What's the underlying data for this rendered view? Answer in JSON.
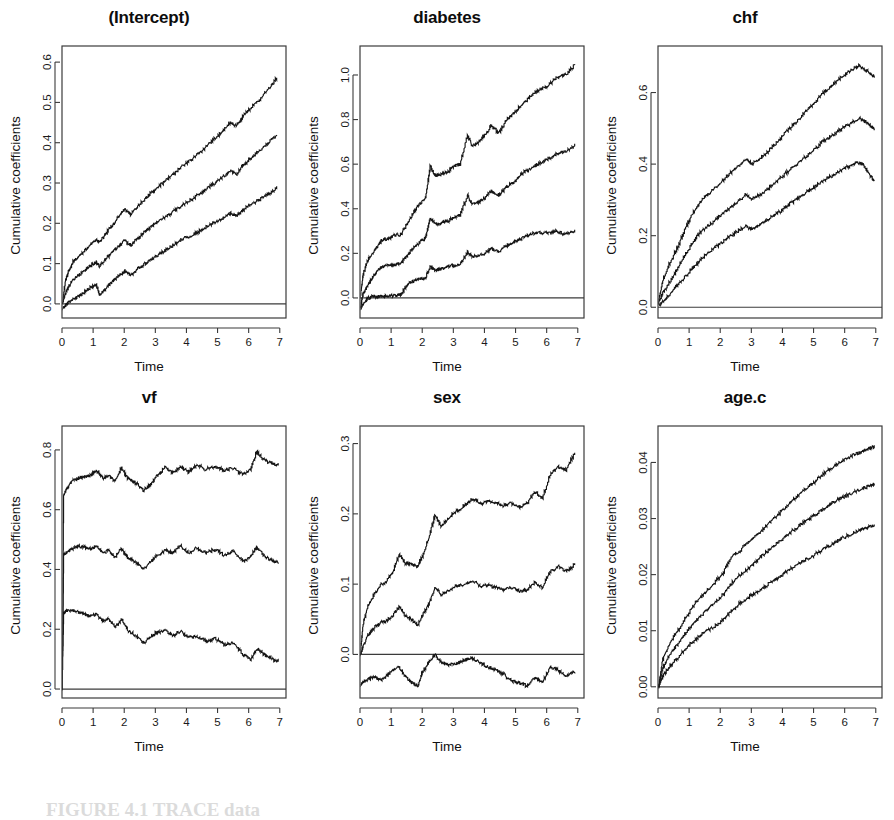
{
  "figure": {
    "caption": "FIGURE 4.1 TRACE data",
    "y_axis_label": "Cumulative coefficients",
    "x_axis_label": "Time"
  },
  "chart_data": [
    {
      "type": "line",
      "title": "(Intercept)",
      "xlabel": "Time",
      "ylabel": "Cumulative coefficients",
      "xlim": [
        0,
        7.2
      ],
      "ylim": [
        -0.035,
        0.64
      ],
      "xticks": [
        0,
        1,
        2,
        3,
        4,
        5,
        6,
        7
      ],
      "yticks": [
        0.0,
        0.1,
        0.2,
        0.3,
        0.4,
        0.5,
        0.6
      ],
      "ytick_labels": [
        "0.0",
        "0.1",
        "0.2",
        "0.3",
        "0.4",
        "0.5",
        "0.6"
      ],
      "grid": false,
      "legend": "none",
      "zero_line": 0.0,
      "x": [
        0,
        0.1,
        0.2,
        0.35,
        0.5,
        0.7,
        0.9,
        1.1,
        1.2,
        1.4,
        1.6,
        1.8,
        2.0,
        2.2,
        2.4,
        2.6,
        2.8,
        3.0,
        3.3,
        3.6,
        3.9,
        4.2,
        4.5,
        4.8,
        5.1,
        5.4,
        5.6,
        5.8,
        6.0,
        6.3,
        6.6,
        6.9
      ],
      "series": [
        {
          "name": "upper confidence band",
          "values": [
            0.0,
            0.055,
            0.08,
            0.105,
            0.115,
            0.13,
            0.148,
            0.158,
            0.152,
            0.175,
            0.195,
            0.215,
            0.235,
            0.222,
            0.24,
            0.256,
            0.272,
            0.285,
            0.305,
            0.325,
            0.345,
            0.362,
            0.382,
            0.405,
            0.425,
            0.45,
            0.443,
            0.465,
            0.482,
            0.505,
            0.53,
            0.562
          ]
        },
        {
          "name": "estimate",
          "values": [
            0.0,
            0.025,
            0.042,
            0.06,
            0.07,
            0.082,
            0.095,
            0.104,
            0.092,
            0.112,
            0.128,
            0.142,
            0.158,
            0.145,
            0.162,
            0.175,
            0.188,
            0.2,
            0.215,
            0.232,
            0.248,
            0.262,
            0.278,
            0.295,
            0.312,
            0.33,
            0.322,
            0.342,
            0.358,
            0.378,
            0.398,
            0.422
          ]
        },
        {
          "name": "lower confidence band",
          "values": [
            -0.012,
            -0.005,
            0.004,
            0.012,
            0.018,
            0.028,
            0.04,
            0.048,
            0.022,
            0.04,
            0.055,
            0.068,
            0.082,
            0.072,
            0.085,
            0.096,
            0.108,
            0.118,
            0.132,
            0.148,
            0.162,
            0.172,
            0.185,
            0.198,
            0.21,
            0.225,
            0.218,
            0.232,
            0.245,
            0.258,
            0.272,
            0.288
          ]
        }
      ]
    },
    {
      "type": "line",
      "title": "diabetes",
      "xlabel": "Time",
      "ylabel": "Cumulative coefficients",
      "xlim": [
        0,
        7.2
      ],
      "ylim": [
        -0.09,
        1.13
      ],
      "xticks": [
        0,
        1,
        2,
        3,
        4,
        5,
        6,
        7
      ],
      "yticks": [
        0.0,
        0.2,
        0.4,
        0.6,
        0.8,
        1.0
      ],
      "ytick_labels": [
        "0.0",
        "0.2",
        "0.4",
        "0.6",
        "0.8",
        "1.0"
      ],
      "grid": false,
      "legend": "none",
      "zero_line": 0.0,
      "x": [
        0,
        0.1,
        0.25,
        0.4,
        0.55,
        0.7,
        0.9,
        1.1,
        1.3,
        1.5,
        1.7,
        1.9,
        2.1,
        2.25,
        2.4,
        2.6,
        2.8,
        3.0,
        3.2,
        3.45,
        3.6,
        3.8,
        4.0,
        4.2,
        4.45,
        4.7,
        4.95,
        5.2,
        5.45,
        5.7,
        6.0,
        6.3,
        6.6,
        6.9
      ],
      "series": [
        {
          "name": "upper confidence band",
          "values": [
            0.0,
            0.11,
            0.17,
            0.2,
            0.23,
            0.26,
            0.265,
            0.28,
            0.285,
            0.33,
            0.38,
            0.42,
            0.45,
            0.59,
            0.55,
            0.555,
            0.565,
            0.59,
            0.6,
            0.73,
            0.68,
            0.7,
            0.73,
            0.77,
            0.74,
            0.8,
            0.83,
            0.87,
            0.9,
            0.93,
            0.95,
            0.99,
            1.0,
            1.05
          ]
        },
        {
          "name": "estimate",
          "values": [
            -0.04,
            0.02,
            0.06,
            0.09,
            0.12,
            0.14,
            0.145,
            0.15,
            0.155,
            0.19,
            0.225,
            0.25,
            0.27,
            0.36,
            0.33,
            0.335,
            0.345,
            0.36,
            0.37,
            0.46,
            0.42,
            0.43,
            0.45,
            0.48,
            0.46,
            0.5,
            0.52,
            0.56,
            0.58,
            0.6,
            0.62,
            0.645,
            0.655,
            0.685
          ]
        },
        {
          "name": "lower confidence band",
          "values": [
            -0.05,
            -0.03,
            0.0,
            0.005,
            0.005,
            0.008,
            0.01,
            0.01,
            0.015,
            0.06,
            0.075,
            0.085,
            0.09,
            0.14,
            0.125,
            0.13,
            0.14,
            0.145,
            0.15,
            0.205,
            0.185,
            0.19,
            0.2,
            0.22,
            0.21,
            0.235,
            0.25,
            0.27,
            0.285,
            0.295,
            0.29,
            0.3,
            0.285,
            0.305
          ]
        }
      ]
    },
    {
      "type": "line",
      "title": "chf",
      "xlabel": "Time",
      "ylabel": "Cumulative coefficients",
      "xlim": [
        0,
        7.2
      ],
      "ylim": [
        -0.03,
        0.73
      ],
      "xticks": [
        0,
        1,
        2,
        3,
        4,
        5,
        6,
        7
      ],
      "yticks": [
        0.0,
        0.2,
        0.4,
        0.6
      ],
      "ytick_labels": [
        "0.0",
        "0.2",
        "0.4",
        "0.6"
      ],
      "grid": false,
      "legend": "none",
      "zero_line": 0.0,
      "x": [
        0,
        0.15,
        0.35,
        0.6,
        0.85,
        1.1,
        1.35,
        1.6,
        1.9,
        2.2,
        2.5,
        2.8,
        3.0,
        3.2,
        3.5,
        3.8,
        4.1,
        4.4,
        4.7,
        5.0,
        5.3,
        5.6,
        5.9,
        6.2,
        6.45,
        6.6,
        6.8,
        6.95
      ],
      "series": [
        {
          "name": "upper confidence band",
          "values": [
            0.015,
            0.075,
            0.12,
            0.165,
            0.215,
            0.262,
            0.295,
            0.315,
            0.34,
            0.365,
            0.39,
            0.415,
            0.4,
            0.41,
            0.435,
            0.46,
            0.49,
            0.515,
            0.545,
            0.57,
            0.6,
            0.62,
            0.645,
            0.662,
            0.675,
            0.668,
            0.652,
            0.645
          ]
        },
        {
          "name": "estimate",
          "values": [
            0.01,
            0.04,
            0.07,
            0.105,
            0.145,
            0.18,
            0.21,
            0.228,
            0.25,
            0.272,
            0.292,
            0.315,
            0.302,
            0.312,
            0.33,
            0.352,
            0.375,
            0.398,
            0.42,
            0.44,
            0.465,
            0.482,
            0.5,
            0.515,
            0.528,
            0.522,
            0.508,
            0.498
          ]
        },
        {
          "name": "lower confidence band",
          "values": [
            0.005,
            0.015,
            0.035,
            0.06,
            0.085,
            0.11,
            0.132,
            0.152,
            0.172,
            0.192,
            0.21,
            0.228,
            0.218,
            0.228,
            0.245,
            0.262,
            0.28,
            0.3,
            0.318,
            0.335,
            0.355,
            0.37,
            0.385,
            0.398,
            0.405,
            0.398,
            0.368,
            0.352
          ]
        }
      ]
    },
    {
      "type": "line",
      "title": "vf",
      "xlabel": "Time",
      "ylabel": "Cumulative coefficients",
      "xlim": [
        0,
        7.2
      ],
      "ylim": [
        -0.03,
        0.88
      ],
      "xticks": [
        0,
        1,
        2,
        3,
        4,
        5,
        6,
        7
      ],
      "yticks": [
        0.0,
        0.2,
        0.4,
        0.6,
        0.8
      ],
      "ytick_labels": [
        "0.0",
        "0.2",
        "0.4",
        "0.6",
        "0.8"
      ],
      "grid": false,
      "legend": "none",
      "zero_line": 0.0,
      "x": [
        0,
        0.05,
        0.15,
        0.3,
        0.5,
        0.7,
        0.9,
        1.1,
        1.3,
        1.5,
        1.7,
        1.9,
        2.1,
        2.35,
        2.6,
        2.85,
        3.05,
        3.3,
        3.55,
        3.8,
        4.05,
        4.3,
        4.6,
        4.9,
        5.2,
        5.5,
        5.8,
        6.05,
        6.25,
        6.5,
        6.75,
        6.95
      ],
      "series": [
        {
          "name": "upper confidence band",
          "values": [
            0.0,
            0.65,
            0.67,
            0.695,
            0.705,
            0.71,
            0.715,
            0.73,
            0.705,
            0.715,
            0.695,
            0.74,
            0.705,
            0.69,
            0.665,
            0.685,
            0.715,
            0.74,
            0.725,
            0.745,
            0.725,
            0.75,
            0.735,
            0.745,
            0.73,
            0.74,
            0.715,
            0.735,
            0.795,
            0.765,
            0.755,
            0.75
          ]
        },
        {
          "name": "estimate",
          "values": [
            0.0,
            0.45,
            0.458,
            0.47,
            0.478,
            0.475,
            0.468,
            0.478,
            0.455,
            0.465,
            0.44,
            0.472,
            0.44,
            0.425,
            0.4,
            0.425,
            0.448,
            0.465,
            0.455,
            0.478,
            0.455,
            0.472,
            0.455,
            0.468,
            0.448,
            0.462,
            0.425,
            0.445,
            0.475,
            0.442,
            0.43,
            0.422
          ]
        },
        {
          "name": "lower confidence band",
          "values": [
            0.0,
            0.255,
            0.262,
            0.265,
            0.258,
            0.25,
            0.245,
            0.248,
            0.228,
            0.235,
            0.205,
            0.232,
            0.198,
            0.178,
            0.155,
            0.175,
            0.19,
            0.195,
            0.178,
            0.195,
            0.172,
            0.178,
            0.16,
            0.168,
            0.148,
            0.155,
            0.115,
            0.098,
            0.135,
            0.115,
            0.1,
            0.092
          ]
        }
      ]
    },
    {
      "type": "line",
      "title": "sex",
      "xlabel": "Time",
      "ylabel": "Cumulative coefficients",
      "xlim": [
        0,
        7.2
      ],
      "ylim": [
        -0.062,
        0.325
      ],
      "xticks": [
        0,
        1,
        2,
        3,
        4,
        5,
        6,
        7
      ],
      "yticks": [
        0.0,
        0.1,
        0.2,
        0.3
      ],
      "ytick_labels": [
        "0.0",
        "0.1",
        "0.2",
        "0.3"
      ],
      "grid": false,
      "legend": "none",
      "zero_line": 0.0,
      "x": [
        0,
        0.1,
        0.25,
        0.45,
        0.65,
        0.85,
        1.05,
        1.25,
        1.45,
        1.65,
        1.85,
        2.0,
        2.2,
        2.4,
        2.6,
        2.85,
        3.1,
        3.35,
        3.6,
        3.85,
        4.1,
        4.35,
        4.6,
        4.85,
        5.1,
        5.35,
        5.6,
        5.85,
        6.1,
        6.35,
        6.6,
        6.9
      ],
      "series": [
        {
          "name": "upper confidence band",
          "values": [
            0.0,
            0.045,
            0.07,
            0.085,
            0.098,
            0.105,
            0.118,
            0.142,
            0.13,
            0.128,
            0.125,
            0.14,
            0.165,
            0.198,
            0.182,
            0.195,
            0.205,
            0.212,
            0.222,
            0.215,
            0.218,
            0.215,
            0.212,
            0.215,
            0.21,
            0.215,
            0.232,
            0.222,
            0.255,
            0.268,
            0.262,
            0.288
          ]
        },
        {
          "name": "estimate",
          "values": [
            0.0,
            0.012,
            0.028,
            0.038,
            0.045,
            0.048,
            0.055,
            0.068,
            0.055,
            0.05,
            0.042,
            0.055,
            0.072,
            0.095,
            0.085,
            0.092,
            0.098,
            0.1,
            0.105,
            0.098,
            0.098,
            0.095,
            0.092,
            0.095,
            0.09,
            0.092,
            0.102,
            0.095,
            0.118,
            0.125,
            0.118,
            0.128
          ]
        },
        {
          "name": "lower confidence band",
          "values": [
            -0.045,
            -0.038,
            -0.035,
            -0.032,
            -0.036,
            -0.03,
            -0.022,
            -0.018,
            -0.032,
            -0.04,
            -0.045,
            -0.025,
            -0.012,
            0.0,
            -0.012,
            -0.015,
            -0.012,
            -0.008,
            -0.005,
            -0.012,
            -0.018,
            -0.022,
            -0.028,
            -0.038,
            -0.04,
            -0.045,
            -0.032,
            -0.04,
            -0.018,
            -0.022,
            -0.03,
            -0.025
          ]
        }
      ]
    },
    {
      "type": "line",
      "title": "age.c",
      "xlabel": "Time",
      "ylabel": "Cumulative coefficients",
      "xlim": [
        0,
        7.2
      ],
      "ylim": [
        -0.002,
        0.0465
      ],
      "xticks": [
        0,
        1,
        2,
        3,
        4,
        5,
        6,
        7
      ],
      "yticks": [
        0.0,
        0.01,
        0.02,
        0.03,
        0.04
      ],
      "ytick_labels": [
        "0.00",
        "0.01",
        "0.02",
        "0.03",
        "0.04"
      ],
      "grid": false,
      "legend": "none",
      "zero_line": 0.0,
      "x": [
        0,
        0.15,
        0.35,
        0.6,
        0.9,
        1.2,
        1.5,
        1.8,
        2.1,
        2.35,
        2.6,
        2.9,
        3.2,
        3.5,
        3.8,
        4.1,
        4.4,
        4.7,
        5.0,
        5.3,
        5.6,
        5.9,
        6.2,
        6.5,
        6.75,
        6.95
      ],
      "series": [
        {
          "name": "upper confidence band",
          "values": [
            0.0,
            0.005,
            0.0075,
            0.0098,
            0.0125,
            0.015,
            0.0168,
            0.0185,
            0.0205,
            0.0232,
            0.0242,
            0.0258,
            0.0272,
            0.029,
            0.0305,
            0.0322,
            0.0338,
            0.0352,
            0.0365,
            0.038,
            0.0392,
            0.0402,
            0.0412,
            0.0418,
            0.0425,
            0.0428
          ]
        },
        {
          "name": "estimate",
          "values": [
            0.0,
            0.0035,
            0.0055,
            0.0075,
            0.0098,
            0.0118,
            0.0135,
            0.015,
            0.0165,
            0.0185,
            0.0198,
            0.0212,
            0.0228,
            0.0242,
            0.0255,
            0.027,
            0.0282,
            0.0295,
            0.0305,
            0.0318,
            0.0328,
            0.0338,
            0.0345,
            0.0352,
            0.0358,
            0.0362
          ]
        },
        {
          "name": "lower confidence band",
          "values": [
            0.0,
            0.002,
            0.0035,
            0.005,
            0.007,
            0.0085,
            0.0098,
            0.0108,
            0.012,
            0.0135,
            0.0148,
            0.016,
            0.017,
            0.0182,
            0.0192,
            0.0205,
            0.0215,
            0.0225,
            0.0235,
            0.0245,
            0.0255,
            0.0265,
            0.0272,
            0.028,
            0.0285,
            0.0288
          ]
        }
      ]
    }
  ]
}
